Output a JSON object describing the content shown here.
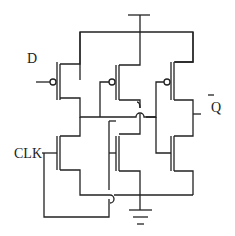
{
  "diagram": {
    "type": "transistor-level circuit schematic",
    "labels": {
      "input_d": "D",
      "clock": "CLK",
      "output_q": "Q",
      "output_q_bar": "¯"
    },
    "components": [
      {
        "id": "P1",
        "kind": "PMOS",
        "gate": "D"
      },
      {
        "id": "P2",
        "kind": "PMOS"
      },
      {
        "id": "P3",
        "kind": "PMOS"
      },
      {
        "id": "N1",
        "kind": "NMOS",
        "gate": "CLK"
      },
      {
        "id": "N2",
        "kind": "NMOS"
      },
      {
        "id": "N3",
        "kind": "NMOS"
      }
    ],
    "symbols": [
      "vdd-bar",
      "ground"
    ]
  }
}
